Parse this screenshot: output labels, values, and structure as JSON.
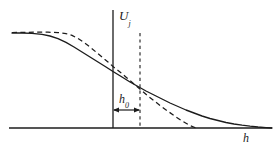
{
  "figure": {
    "background_color": "#ffffff",
    "ink_color": "#1c1c1c",
    "axes": {
      "vertical_axis_label_base": "U",
      "vertical_axis_label_subscript": "j",
      "horizontal_axis_label": "h",
      "x_axis_y_px": 128,
      "x_axis_x_start_px": 9,
      "x_axis_x_end_px": 272,
      "y_axis_x_px": 113,
      "y_axis_y_top_px": 10,
      "y_axis_y_bottom_px": 128
    },
    "annotations": {
      "interval_label_base": "h",
      "interval_label_subscript": "0",
      "interval_arrow_y_px": 110,
      "interval_arrow_x_start_px": 113,
      "interval_arrow_x_end_px": 140,
      "reference_line_x_px": 140,
      "reference_line_y_top_px": 33,
      "reference_line_y_bottom_px": 128,
      "reference_line_style": "dashed"
    }
  },
  "chart_data": {
    "type": "line",
    "title": "",
    "xlabel": "h",
    "ylabel": "U_j",
    "grid": false,
    "legend": "none",
    "xlim": [
      9,
      272
    ],
    "ylim": [
      128,
      10
    ],
    "axis_units": "pixels (uncalibrated schematic)",
    "series": [
      {
        "name": "solid-curve",
        "style": "solid",
        "color": "#1c1c1c",
        "description": "Smooth sigmoid-like decay of U_j with increasing h, asymptotic to the h axis on the right",
        "points": [
          [
            12,
            33
          ],
          [
            22,
            33
          ],
          [
            32,
            33.4
          ],
          [
            42,
            34.4
          ],
          [
            50,
            36
          ],
          [
            58,
            38.6
          ],
          [
            66,
            42.4
          ],
          [
            74,
            47
          ],
          [
            82,
            52
          ],
          [
            90,
            57
          ],
          [
            98,
            62
          ],
          [
            106,
            67
          ],
          [
            113,
            71.5
          ],
          [
            122,
            77
          ],
          [
            130,
            82
          ],
          [
            138,
            86.5
          ],
          [
            146,
            91
          ],
          [
            154,
            95
          ],
          [
            162,
            99
          ],
          [
            170,
            103
          ],
          [
            178,
            106.5
          ],
          [
            186,
            110
          ],
          [
            194,
            113
          ],
          [
            202,
            116
          ],
          [
            210,
            118.5
          ],
          [
            218,
            120.5
          ],
          [
            226,
            122.5
          ],
          [
            234,
            124
          ],
          [
            242,
            125.2
          ],
          [
            250,
            126.2
          ],
          [
            258,
            127
          ],
          [
            266,
            127.6
          ],
          [
            272,
            128
          ]
        ]
      },
      {
        "name": "dashed-curve",
        "style": "dashed",
        "color": "#1c1c1c",
        "description": "Piecewise approximation: flatter plateau, steeper central drop, reaching the h axis near h = 196",
        "points": [
          [
            12,
            32.5
          ],
          [
            24,
            32.3
          ],
          [
            36,
            32.2
          ],
          [
            48,
            32.2
          ],
          [
            58,
            32.6
          ],
          [
            66,
            33.6
          ],
          [
            72,
            35.4
          ],
          [
            78,
            38.5
          ],
          [
            84,
            42.5
          ],
          [
            90,
            47
          ],
          [
            96,
            52
          ],
          [
            102,
            57
          ],
          [
            108,
            62
          ],
          [
            113,
            66.5
          ],
          [
            120,
            72
          ],
          [
            127,
            78
          ],
          [
            134,
            84
          ],
          [
            141,
            90
          ],
          [
            148,
            96
          ],
          [
            155,
            101.5
          ],
          [
            162,
            107
          ],
          [
            169,
            112
          ],
          [
            176,
            117
          ],
          [
            183,
            121.5
          ],
          [
            190,
            125.5
          ],
          [
            196,
            128
          ]
        ]
      }
    ]
  }
}
